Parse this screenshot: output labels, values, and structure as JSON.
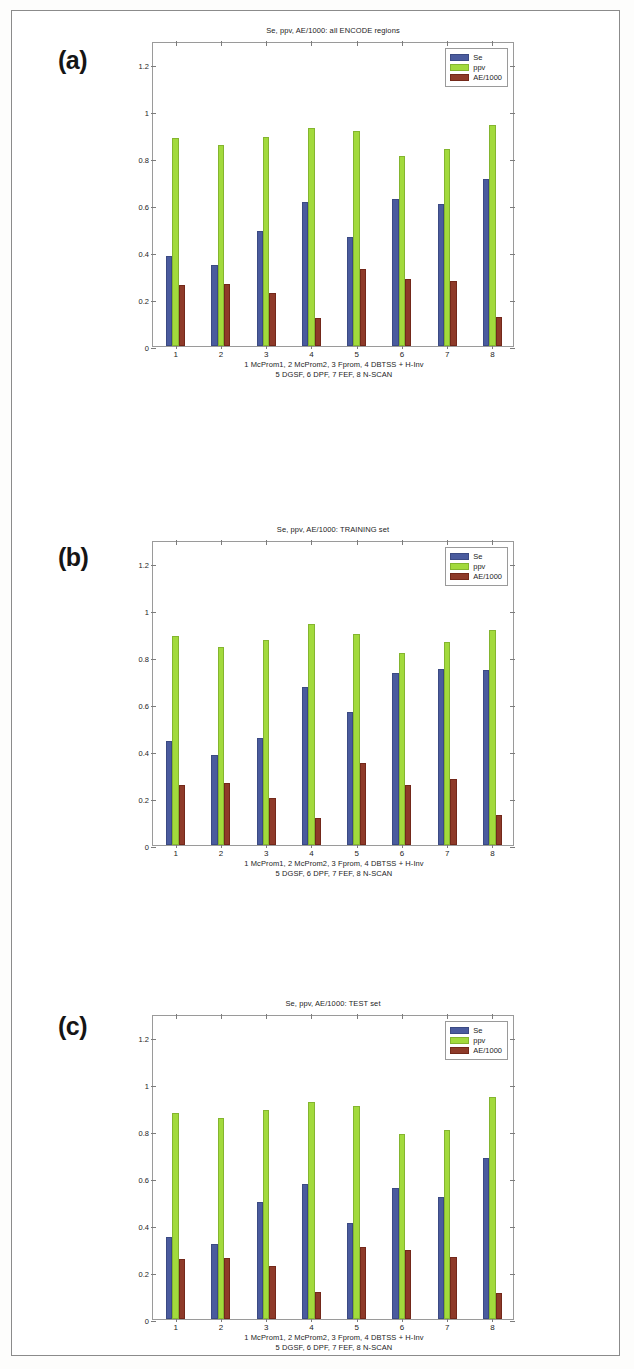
{
  "page": {
    "border_color": "#8b8b8b",
    "background": "#ffffff"
  },
  "series_colors": {
    "Se": "#4a5b9e",
    "ppv": "#a2da3c",
    "AE/1000": "#8e3a29"
  },
  "legend": {
    "entries": [
      "Se",
      "ppv",
      "AE/1000"
    ]
  },
  "axis": {
    "y_ticks": [
      "0",
      "0.2",
      "0.4",
      "0.6",
      "0.8",
      "1",
      "1.2"
    ],
    "y_tick_values": [
      0,
      0.2,
      0.4,
      0.6,
      0.8,
      1,
      1.2
    ],
    "x_ticks": [
      "1",
      "2",
      "3",
      "4",
      "5",
      "6",
      "7",
      "8"
    ],
    "ylim": [
      0,
      1.3
    ]
  },
  "caption": {
    "line1": "1 McProm1, 2 McProm2, 3 Fprom, 4 DBTSS + H-Inv",
    "line2": "5 DGSF,    6 DPF,    7 FEF,   8 N-SCAN"
  },
  "panels": [
    {
      "label": "(a)",
      "title": "Se, ppv, AE/1000: all ENCODE regions"
    },
    {
      "label": "(b)",
      "title": "Se, ppv, AE/1000: TRAINING set"
    },
    {
      "label": "(c)",
      "title": "Se, ppv, AE/1000: TEST set"
    }
  ],
  "chart_data": [
    {
      "type": "bar",
      "title": "Se, ppv, AE/1000: all ENCODE regions",
      "panel": "(a)",
      "xlabel": "1 McProm1, 2 McProm2, 3 Fprom, 4 DBTSS + H-Inv / 5 DGSF, 6 DPF, 7 FEF, 8 N-SCAN",
      "ylabel": "",
      "ylim": [
        0,
        1.3
      ],
      "grid": false,
      "legend_position": "top-right",
      "categories": [
        "1",
        "2",
        "3",
        "4",
        "5",
        "6",
        "7",
        "8"
      ],
      "category_names": [
        "McProm1",
        "McProm2",
        "Fprom",
        "DBTSS + H-Inv",
        "DGSF",
        "DPF",
        "FEF",
        "N-SCAN"
      ],
      "series": [
        {
          "name": "Se",
          "values": [
            0.385,
            0.345,
            0.49,
            0.615,
            0.465,
            0.625,
            0.605,
            0.71
          ]
        },
        {
          "name": "ppv",
          "values": [
            0.885,
            0.855,
            0.89,
            0.93,
            0.915,
            0.81,
            0.84,
            0.94
          ]
        },
        {
          "name": "AE/1000",
          "values": [
            0.26,
            0.265,
            0.225,
            0.12,
            0.33,
            0.285,
            0.275,
            0.125
          ]
        }
      ]
    },
    {
      "type": "bar",
      "title": "Se, ppv, AE/1000: TRAINING set",
      "panel": "(b)",
      "xlabel": "1 McProm1, 2 McProm2, 3 Fprom, 4 DBTSS + H-Inv / 5 DGSF, 6 DPF, 7 FEF, 8 N-SCAN",
      "ylabel": "",
      "ylim": [
        0,
        1.3
      ],
      "grid": false,
      "legend_position": "top-right",
      "categories": [
        "1",
        "2",
        "3",
        "4",
        "5",
        "6",
        "7",
        "8"
      ],
      "category_names": [
        "McProm1",
        "McProm2",
        "Fprom",
        "DBTSS + H-Inv",
        "DGSF",
        "DPF",
        "FEF",
        "N-SCAN"
      ],
      "series": [
        {
          "name": "Se",
          "values": [
            0.445,
            0.385,
            0.455,
            0.675,
            0.565,
            0.735,
            0.75,
            0.745
          ]
        },
        {
          "name": "ppv",
          "values": [
            0.89,
            0.845,
            0.875,
            0.94,
            0.9,
            0.82,
            0.865,
            0.915
          ]
        },
        {
          "name": "AE/1000",
          "values": [
            0.255,
            0.265,
            0.2,
            0.115,
            0.35,
            0.255,
            0.28,
            0.13
          ]
        }
      ]
    },
    {
      "type": "bar",
      "title": "Se, ppv, AE/1000: TEST set",
      "panel": "(c)",
      "xlabel": "1 McProm1, 2 McProm2, 3 Fprom, 4 DBTSS + H-Inv / 5 DGSF, 6 DPF, 7 FEF, 8 N-SCAN",
      "ylabel": "",
      "ylim": [
        0,
        1.3
      ],
      "grid": false,
      "legend_position": "top-right",
      "categories": [
        "1",
        "2",
        "3",
        "4",
        "5",
        "6",
        "7",
        "8"
      ],
      "category_names": [
        "McProm1",
        "McProm2",
        "Fprom",
        "DBTSS + H-Inv",
        "DGSF",
        "DPF",
        "FEF",
        "N-SCAN"
      ],
      "series": [
        {
          "name": "Se",
          "values": [
            0.35,
            0.32,
            0.5,
            0.575,
            0.41,
            0.56,
            0.52,
            0.685
          ]
        },
        {
          "name": "ppv",
          "values": [
            0.88,
            0.855,
            0.89,
            0.925,
            0.91,
            0.79,
            0.805,
            0.945
          ]
        },
        {
          "name": "AE/1000",
          "values": [
            0.255,
            0.26,
            0.225,
            0.115,
            0.305,
            0.295,
            0.265,
            0.11
          ]
        }
      ]
    }
  ]
}
